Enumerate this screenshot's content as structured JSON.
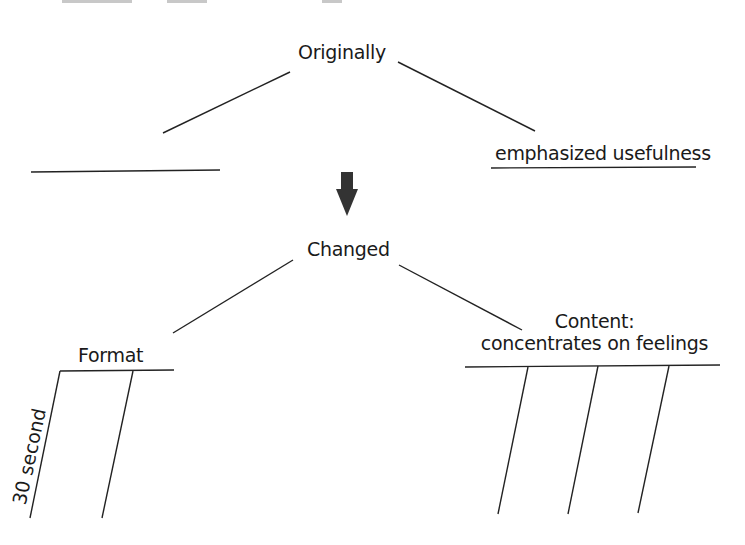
{
  "diagram": {
    "type": "fishbone-style-comparison",
    "top": {
      "label": "Originally",
      "branches": [
        {
          "label": "",
          "position": "left"
        },
        {
          "label": "emphasized usefulness",
          "position": "right"
        }
      ]
    },
    "arrow": {
      "direction": "down",
      "icon": "down-arrow-icon",
      "color": "#333333"
    },
    "bottom": {
      "label": "Changed",
      "branches": [
        {
          "label": "Format",
          "position": "left",
          "sub_lines": [
            {
              "label": "30 second"
            },
            {
              "label": ""
            }
          ]
        },
        {
          "label_line1": "Content:",
          "label_line2": "concentrates on feelings",
          "position": "right",
          "sub_lines": [
            {
              "label": ""
            },
            {
              "label": ""
            },
            {
              "label": ""
            }
          ]
        }
      ]
    },
    "line_color": "#222222"
  }
}
